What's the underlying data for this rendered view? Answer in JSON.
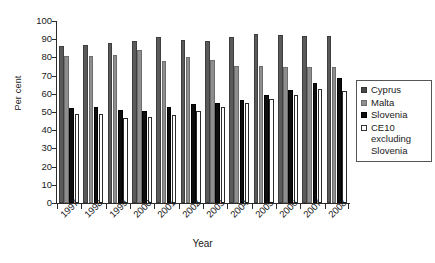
{
  "chart_data": {
    "type": "bar",
    "title": "",
    "xlabel": "Year",
    "ylabel": "Per cent",
    "ylim": [
      0,
      100
    ],
    "ytick_step": 10,
    "yticks": [
      "100",
      "90",
      "80",
      "70",
      "60",
      "50",
      "40",
      "30",
      "20",
      "10",
      "0"
    ],
    "grid": false,
    "legend_position": "right",
    "categories": [
      "1997",
      "1998",
      "1999",
      "2000",
      "2001",
      "2002",
      "2003",
      "2004",
      "2005",
      "2006",
      "2007",
      "2008"
    ],
    "series": [
      {
        "name": "Cyprus",
        "color": "#5a5a5a",
        "values": [
          86.5,
          87.0,
          88.0,
          89.0,
          91.0,
          89.5,
          89.0,
          91.0,
          93.0,
          92.5,
          92.0,
          91.5
        ]
      },
      {
        "name": "Malta",
        "color": "#8e8e8e",
        "values": [
          81.0,
          81.0,
          81.5,
          84.0,
          78.0,
          80.0,
          78.5,
          75.5,
          75.5,
          75.0,
          75.0,
          74.5
        ]
      },
      {
        "name": "Slovenia",
        "color": "#0d0d0d",
        "values": [
          52.0,
          52.5,
          51.0,
          50.5,
          52.5,
          54.5,
          55.0,
          56.5,
          59.5,
          62.0,
          66.0,
          68.5
        ]
      },
      {
        "name": "CE10 excluding Slovenia",
        "color": "#ffffff",
        "values": [
          49.0,
          49.0,
          46.5,
          47.5,
          48.5,
          50.5,
          53.0,
          55.0,
          57.0,
          59.5,
          62.5,
          61.5
        ]
      }
    ]
  },
  "legend": {
    "entries": [
      {
        "label": "Cyprus"
      },
      {
        "label": "Malta"
      },
      {
        "label": "Slovenia"
      },
      {
        "label": "CE10 excluding Slovenia"
      }
    ]
  }
}
